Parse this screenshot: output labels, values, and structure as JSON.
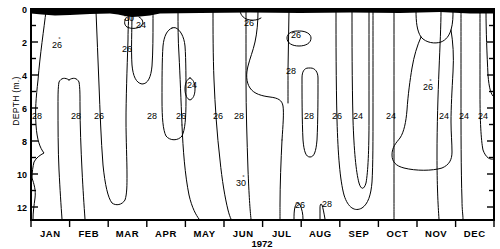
{
  "figure": {
    "type": "contour",
    "axis": {
      "y_axis_label": "DEPTH (m.)",
      "y_ticks": [
        "0",
        "2",
        "4",
        "6",
        "8",
        "10",
        "12"
      ],
      "y_range": [
        0,
        12.8
      ],
      "x_axis_label": "1972",
      "x_ticks": [
        "JAN",
        "FEB",
        "MAR",
        "APR",
        "MAY",
        "JUN",
        "JUL",
        "AUG",
        "SEP",
        "OCT",
        "NOV",
        "DEC"
      ]
    },
    "surface_band_note": "filled-black-surface-band"
  },
  "chart_data": {
    "type": "line",
    "title": "",
    "subtitle": "",
    "xlabel": "1972",
    "ylabel": "DEPTH (m.)",
    "xlim": [
      0,
      12
    ],
    "ylim": [
      12.8,
      0
    ],
    "grid": false,
    "legend": null,
    "variable": "water temperature isotherms (degrees C)",
    "contour_levels": [
      24,
      26,
      28,
      30
    ],
    "x": [
      "JAN",
      "FEB",
      "MAR",
      "APR",
      "MAY",
      "JUN",
      "JUL",
      "AUG",
      "SEP",
      "OCT",
      "NOV",
      "DEC"
    ],
    "inline_labels": [
      {
        "text": "30",
        "degree": true,
        "x": 129,
        "y": 21,
        "note": "closed cell at surface near MAR"
      },
      {
        "text": "24",
        "degree": false,
        "x": 141,
        "y": 28,
        "note": "below 30 cell near MAR"
      },
      {
        "text": "26",
        "degree": true,
        "x": 57,
        "y": 48,
        "note": "JAN-FEB upper"
      },
      {
        "text": "26",
        "degree": false,
        "x": 127,
        "y": 52,
        "note": "MAR upper"
      },
      {
        "text": "26",
        "degree": false,
        "x": 249,
        "y": 26,
        "note": "JUN-JUL surface"
      },
      {
        "text": "26",
        "degree": false,
        "x": 296,
        "y": 38,
        "note": "closed cell AUG surface"
      },
      {
        "text": "28",
        "degree": false,
        "x": 291,
        "y": 74,
        "note": "AUG mid"
      },
      {
        "text": "24",
        "degree": false,
        "x": 192,
        "y": 88,
        "note": "closed cell MAY"
      },
      {
        "text": "26",
        "degree": true,
        "x": 428,
        "y": 90,
        "note": "NOV mid"
      },
      {
        "text": "30",
        "degree": true,
        "x": 241,
        "y": 186,
        "note": "JUN deep"
      },
      {
        "text": "26",
        "degree": false,
        "x": 300,
        "y": 208,
        "note": "AUG bottom"
      },
      {
        "text": "28",
        "degree": false,
        "x": 327,
        "y": 207,
        "note": "AUG bottom"
      },
      {
        "text": "28",
        "degree": false,
        "x": 37,
        "y": 119,
        "note": "row at 6 m"
      },
      {
        "text": "28",
        "degree": false,
        "x": 76,
        "y": 119,
        "note": "row at 6 m"
      },
      {
        "text": "26",
        "degree": false,
        "x": 99,
        "y": 119,
        "note": "row at 6 m"
      },
      {
        "text": "28",
        "degree": false,
        "x": 152,
        "y": 119,
        "note": "row at 6 m"
      },
      {
        "text": "26",
        "degree": false,
        "x": 181,
        "y": 119,
        "note": "row at 6 m"
      },
      {
        "text": "26",
        "degree": false,
        "x": 218,
        "y": 119,
        "note": "row at 6 m"
      },
      {
        "text": "28",
        "degree": false,
        "x": 239,
        "y": 119,
        "note": "row at 6 m"
      },
      {
        "text": "28",
        "degree": false,
        "x": 309,
        "y": 119,
        "note": "row at 6 m"
      },
      {
        "text": "26",
        "degree": false,
        "x": 337,
        "y": 119,
        "note": "row at 6 m"
      },
      {
        "text": "24",
        "degree": false,
        "x": 358,
        "y": 119,
        "note": "row at 6 m"
      },
      {
        "text": "24",
        "degree": false,
        "x": 391,
        "y": 119,
        "note": "row at 6 m"
      },
      {
        "text": "24",
        "degree": false,
        "x": 444,
        "y": 119,
        "note": "row at 6 m"
      },
      {
        "text": "24",
        "degree": false,
        "x": 464,
        "y": 119,
        "note": "row at 6 m"
      },
      {
        "text": "24",
        "degree": false,
        "x": 483,
        "y": 119,
        "note": "row at 6 m"
      }
    ]
  }
}
